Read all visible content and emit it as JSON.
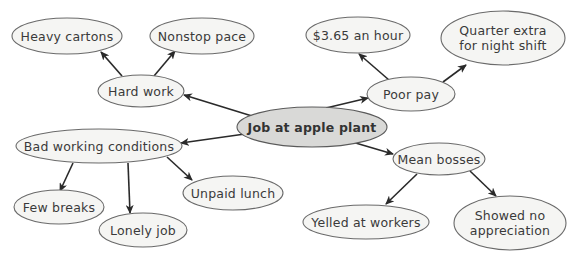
{
  "diagram": {
    "type": "concept-map",
    "central": {
      "id": "job",
      "label": "Job at apple plant",
      "cx": 312,
      "cy": 127,
      "rx": 75,
      "ry": 20
    },
    "nodes": [
      {
        "id": "hard-work",
        "label": "Hard work",
        "cx": 141,
        "cy": 91,
        "rx": 43,
        "ry": 16
      },
      {
        "id": "heavy-cartons",
        "label": "Heavy cartons",
        "cx": 67,
        "cy": 36,
        "rx": 55,
        "ry": 18
      },
      {
        "id": "nonstop-pace",
        "label": "Nonstop pace",
        "cx": 202,
        "cy": 36,
        "rx": 52,
        "ry": 18
      },
      {
        "id": "poor-pay",
        "label": "Poor pay",
        "cx": 411,
        "cy": 94,
        "rx": 44,
        "ry": 17
      },
      {
        "id": "wage",
        "label": "$3.65 an hour",
        "cx": 358,
        "cy": 35,
        "rx": 52,
        "ry": 18
      },
      {
        "id": "night-shift",
        "label": "Quarter extra\nfor night shift",
        "cx": 503,
        "cy": 38,
        "rx": 62,
        "ry": 27
      },
      {
        "id": "bad-conditions",
        "label": "Bad working conditions",
        "cx": 99,
        "cy": 146,
        "rx": 83,
        "ry": 17
      },
      {
        "id": "few-breaks",
        "label": "Few breaks",
        "cx": 59,
        "cy": 207,
        "rx": 45,
        "ry": 17
      },
      {
        "id": "lonely-job",
        "label": "Lonely job",
        "cx": 143,
        "cy": 230,
        "rx": 44,
        "ry": 17
      },
      {
        "id": "unpaid-lunch",
        "label": "Unpaid lunch",
        "cx": 233,
        "cy": 193,
        "rx": 50,
        "ry": 17
      },
      {
        "id": "mean-bosses",
        "label": "Mean bosses",
        "cx": 439,
        "cy": 159,
        "rx": 46,
        "ry": 16
      },
      {
        "id": "yelled",
        "label": "Yelled at workers",
        "cx": 366,
        "cy": 222,
        "rx": 63,
        "ry": 17
      },
      {
        "id": "no-appreciation",
        "label": "Showed no\nappreciation",
        "cx": 510,
        "cy": 223,
        "rx": 56,
        "ry": 27
      }
    ],
    "edges": [
      {
        "from": "job",
        "to": "hard-work",
        "x1": 252,
        "y1": 116,
        "x2": 184,
        "y2": 95
      },
      {
        "from": "hard-work",
        "to": "heavy-cartons",
        "x1": 122,
        "y1": 76,
        "x2": 101,
        "y2": 52
      },
      {
        "from": "hard-work",
        "to": "nonstop-pace",
        "x1": 154,
        "y1": 76,
        "x2": 175,
        "y2": 51
      },
      {
        "from": "job",
        "to": "poor-pay",
        "x1": 326,
        "y1": 108,
        "x2": 368,
        "y2": 98
      },
      {
        "from": "poor-pay",
        "to": "wage",
        "x1": 389,
        "y1": 80,
        "x2": 359,
        "y2": 54
      },
      {
        "from": "poor-pay",
        "to": "night-shift",
        "x1": 443,
        "y1": 82,
        "x2": 466,
        "y2": 65
      },
      {
        "from": "job",
        "to": "bad-conditions",
        "x1": 252,
        "y1": 133,
        "x2": 181,
        "y2": 143
      },
      {
        "from": "bad-conditions",
        "to": "few-breaks",
        "x1": 73,
        "y1": 163,
        "x2": 60,
        "y2": 191
      },
      {
        "from": "bad-conditions",
        "to": "lonely-job",
        "x1": 128,
        "y1": 163,
        "x2": 130,
        "y2": 213
      },
      {
        "from": "bad-conditions",
        "to": "unpaid-lunch",
        "x1": 167,
        "y1": 157,
        "x2": 192,
        "y2": 180
      },
      {
        "from": "job",
        "to": "mean-bosses",
        "x1": 342,
        "y1": 139,
        "x2": 393,
        "y2": 154
      },
      {
        "from": "mean-bosses",
        "to": "yelled",
        "x1": 417,
        "y1": 174,
        "x2": 386,
        "y2": 204
      },
      {
        "from": "mean-bosses",
        "to": "no-appreciation",
        "x1": 470,
        "y1": 171,
        "x2": 496,
        "y2": 196
      }
    ],
    "colors": {
      "node_fill": "#f5f5f3",
      "central_fill": "#d9d9d7",
      "node_stroke": "#6a6a6a",
      "edge": "#2a2a2a",
      "text": "#3a3a3a"
    }
  }
}
